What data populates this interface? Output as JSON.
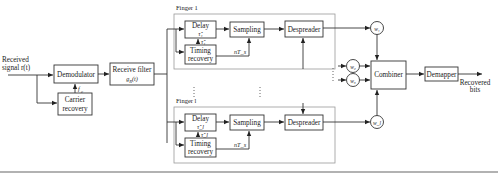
{
  "diagram": {
    "input": {
      "line1": "Received",
      "line2": "signal r(t)"
    },
    "demodulator": {
      "label": "Demodulator"
    },
    "carrier_recovery": {
      "line1": "Carrier",
      "line2": "recovery",
      "output_label": "f_c"
    },
    "receive_filter": {
      "line1": "Receive filter",
      "line2": "g_R(t)"
    },
    "fingers": [
      {
        "title": "Finger 1",
        "delay": {
          "line1": "Delay",
          "line2": "τ̂₁"
        },
        "tau_label": "τ̂₁",
        "timing_recovery": {
          "line1": "Timing",
          "line2": "recovery"
        },
        "sampling": {
          "label": "Sampling"
        },
        "sample_time": "nT_s",
        "despreader": {
          "label": "Despreader"
        },
        "weight": "w₁"
      },
      {
        "title": "Finger l",
        "delay": {
          "line1": "Delay",
          "line2": "τ̂_l"
        },
        "tau_label": "τ̂_l",
        "timing_recovery": {
          "line1": "Timing",
          "line2": "recovery"
        },
        "sampling": {
          "label": "Sampling"
        },
        "sample_time": "nT_s",
        "despreader": {
          "label": "Despreader"
        },
        "weight": "w_l"
      }
    ],
    "extra_weights": [
      "w₂",
      "w₃"
    ],
    "combiner": {
      "label": "Combiner"
    },
    "demapper": {
      "label": "Demapper"
    },
    "output": {
      "line1": "Recovered",
      "line2": "bits"
    }
  }
}
